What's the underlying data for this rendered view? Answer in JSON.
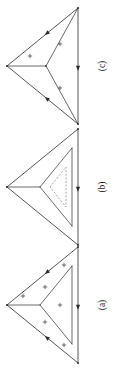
{
  "figure": {
    "name": "triangle-subdivision-figure",
    "orientation": "rotated-90-ccw",
    "background_color": "#ffffff",
    "line_color": "#2b2b2b",
    "dashed_line_color": "#6e6e6e",
    "width_px": 121,
    "height_px": 388,
    "panel_count": 3
  },
  "panels": [
    {
      "id": "panel-c",
      "label": "(c)",
      "label_x": 103,
      "label_y": 66,
      "center_y": 66,
      "description": "Outer triangle with interior Y-shaped edges joining a central node to the three vertices; three plus signs, one in each sub-region.",
      "outer_triangle": {
        "apex_left": [
          7,
          66
        ],
        "vertex_top_right": [
          78,
          8
        ],
        "vertex_bottom_right": [
          78,
          124
        ]
      },
      "center_node": [
        46,
        66
      ],
      "inner_edges": [
        [
          [
            46,
            66
          ],
          [
            7,
            66
          ]
        ],
        [
          [
            46,
            66
          ],
          [
            78,
            8
          ]
        ],
        [
          [
            46,
            66
          ],
          [
            78,
            124
          ]
        ]
      ],
      "inner_triangle": null,
      "dashed_triangle": null,
      "plus_signs": [
        {
          "x": 30,
          "y": 56
        },
        {
          "x": 60,
          "y": 44
        },
        {
          "x": 60,
          "y": 88
        }
      ],
      "arrows": [
        {
          "on_edge": "apex-left-to-top-right",
          "t": 0.56,
          "direction": "toward-apex-left"
        },
        {
          "on_edge": "apex-left-to-bottom-right",
          "t": 0.56,
          "direction": "toward-apex-left"
        },
        {
          "on_edge": "right-vertical",
          "t": 0.52,
          "direction": "downward"
        }
      ]
    },
    {
      "id": "panel-b",
      "label": "(b)",
      "label_x": 103,
      "label_y": 187,
      "center_y": 187,
      "description": "Outer triangle containing a medium inverted inner triangle (solid) plus a smaller dashed triangle nested inside it; no plus signs.",
      "outer_triangle": {
        "apex_left": [
          7,
          187
        ],
        "vertex_top_right": [
          78,
          129
        ],
        "vertex_bottom_right": [
          78,
          245
        ]
      },
      "center_node": null,
      "inner_edges": [
        [
          [
            7,
            187
          ],
          [
            40,
            187
          ]
        ],
        [
          [
            40,
            187
          ],
          [
            72,
            148
          ]
        ],
        [
          [
            72,
            148
          ],
          [
            72,
            226
          ]
        ],
        [
          [
            72,
            226
          ],
          [
            40,
            187
          ]
        ]
      ],
      "inner_triangle": {
        "vertices": [
          [
            40,
            187
          ],
          [
            72,
            148
          ],
          [
            72,
            226
          ]
        ],
        "style": "solid"
      },
      "dashed_triangle": {
        "vertices": [
          [
            50,
            187
          ],
          [
            66,
            167
          ],
          [
            66,
            207
          ]
        ],
        "style": "dashed"
      },
      "plus_signs": [],
      "arrows": [
        {
          "on_edge": "right-vertical",
          "t": 0.52,
          "direction": "downward"
        }
      ]
    },
    {
      "id": "panel-a",
      "label": "(a)",
      "label_x": 103,
      "label_y": 305,
      "center_y": 305,
      "description": "Outer triangle containing a solid inner triangle; five plus signs distributed in the corner regions and the inner triangle.",
      "outer_triangle": {
        "apex_left": [
          7,
          305
        ],
        "vertex_top_right": [
          78,
          247
        ],
        "vertex_bottom_right": [
          78,
          363
        ]
      },
      "center_node": null,
      "inner_edges": [
        [
          [
            7,
            305
          ],
          [
            40,
            305
          ]
        ],
        [
          [
            40,
            305
          ],
          [
            72,
            266
          ]
        ],
        [
          [
            72,
            266
          ],
          [
            72,
            344
          ]
        ],
        [
          [
            72,
            344
          ],
          [
            40,
            305
          ]
        ]
      ],
      "inner_triangle": {
        "vertices": [
          [
            40,
            305
          ],
          [
            72,
            266
          ],
          [
            72,
            344
          ]
        ],
        "style": "solid"
      },
      "dashed_triangle": null,
      "plus_signs": [
        {
          "x": 23,
          "y": 296
        },
        {
          "x": 45,
          "y": 287
        },
        {
          "x": 45,
          "y": 322
        },
        {
          "x": 60,
          "y": 305
        },
        {
          "x": 64,
          "y": 265
        },
        {
          "x": 64,
          "y": 345
        }
      ],
      "arrows": [
        {
          "on_edge": "apex-left-to-top-right",
          "t": 0.56,
          "direction": "toward-apex-left"
        },
        {
          "on_edge": "apex-left-to-bottom-right",
          "t": 0.56,
          "direction": "toward-apex-left"
        },
        {
          "on_edge": "right-vertical",
          "t": 0.52,
          "direction": "downward"
        }
      ]
    }
  ],
  "chart_data": {
    "type": "diagram",
    "title": "",
    "subtitle": "",
    "xlabel": "",
    "ylabel": "",
    "legend": [],
    "annotations": [
      "(a)",
      "(b)",
      "(c)"
    ],
    "series": [
      {
        "name": "(a)",
        "shape": "triangle-with-inner-triangle",
        "plus_count": 6,
        "dashed": false,
        "arrow_count": 3
      },
      {
        "name": "(b)",
        "shape": "triangle-with-inner-and-dashed-triangle",
        "plus_count": 0,
        "dashed": true,
        "arrow_count": 1
      },
      {
        "name": "(c)",
        "shape": "triangle-with-central-y-junction",
        "plus_count": 3,
        "dashed": false,
        "arrow_count": 3
      }
    ]
  }
}
